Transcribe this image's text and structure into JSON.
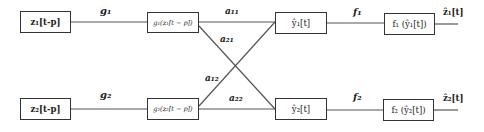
{
  "diagram": {
    "type": "network block diagram",
    "nodes": {
      "z1": "z₁[t-p]",
      "z2": "z₂[t-p]",
      "g1": "g₁(z₁[t − p])",
      "g2": "g₂(z₂[t − p])",
      "y1": "ŷ₁[t]",
      "y2": "ŷ₂[t]",
      "f1": "f₁ (ŷ₁[t])",
      "f2": "f₂ (ŷ₂[t])"
    },
    "edge_labels": {
      "g1": "g₁",
      "g2": "g₂",
      "a11": "a₁₁",
      "a21": "a₂₁",
      "a12": "a₁₂",
      "a22": "a₂₂",
      "f1": "f₁",
      "f2": "f₂"
    },
    "outputs": {
      "z1hat": "ẑ₁[t]",
      "z2hat": "ẑ₂[t]"
    },
    "edges": [
      {
        "from": "z1",
        "to": "g1",
        "label": "g1"
      },
      {
        "from": "z2",
        "to": "g2",
        "label": "g2"
      },
      {
        "from": "g1",
        "to": "y1",
        "label": "a11"
      },
      {
        "from": "g1",
        "to": "y2",
        "label": "a21"
      },
      {
        "from": "g2",
        "to": "y1",
        "label": "a12"
      },
      {
        "from": "g2",
        "to": "y2",
        "label": "a22"
      },
      {
        "from": "y1",
        "to": "f1",
        "label": "f1"
      },
      {
        "from": "y2",
        "to": "f2",
        "label": "f2"
      },
      {
        "from": "f1",
        "to": "z1hat"
      },
      {
        "from": "f2",
        "to": "z2hat"
      }
    ]
  }
}
